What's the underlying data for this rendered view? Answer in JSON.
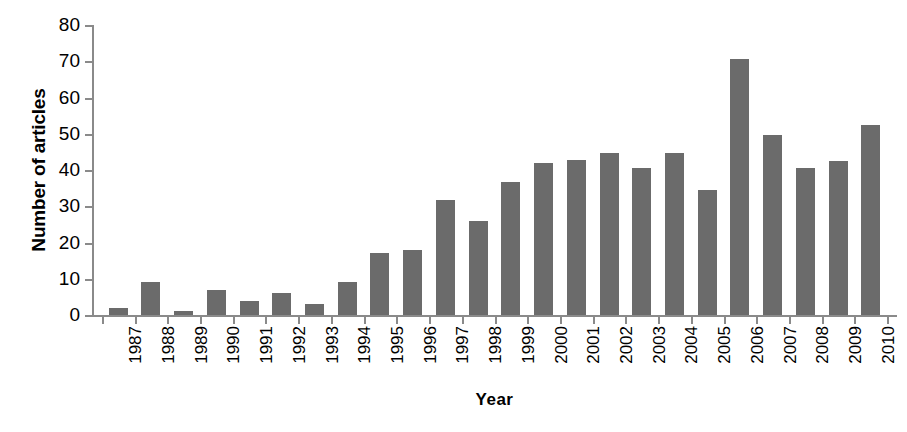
{
  "chart_data": {
    "type": "bar",
    "title": "",
    "xlabel": "Year",
    "ylabel": "Number of articles",
    "categories": [
      "1987",
      "1988",
      "1989",
      "1990",
      "1991",
      "1992",
      "1993",
      "1994",
      "1995",
      "1996",
      "1997",
      "1998",
      "1999",
      "2000",
      "2001",
      "2002",
      "2003",
      "2004",
      "2005",
      "2006",
      "2007",
      "2008",
      "2009",
      "2010"
    ],
    "values": [
      2,
      9,
      1,
      7,
      4,
      6,
      3,
      9,
      17,
      17.8,
      31.7,
      26,
      36.7,
      41.8,
      42.7,
      44.7,
      40.6,
      44.7,
      34.6,
      70.6,
      49.6,
      40.6,
      42.5,
      52.5
    ],
    "ylim": [
      0,
      80
    ],
    "yticks": [
      0,
      10,
      20,
      30,
      40,
      50,
      60,
      70,
      80
    ],
    "ytick_labels": [
      "0",
      "10",
      "20",
      "30",
      "40",
      "50",
      "60",
      "70",
      "80"
    ],
    "grid": false,
    "legend": "none",
    "bar_color": "#6b6b6b",
    "axis_color": "#8a8a8a",
    "background_color": "#ffffff"
  }
}
